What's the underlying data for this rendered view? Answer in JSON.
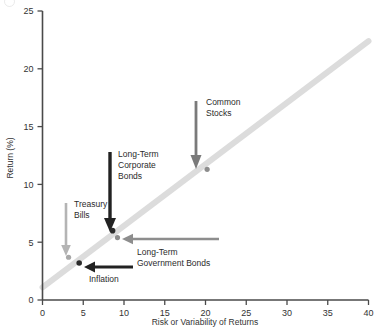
{
  "chart_data": {
    "type": "scatter",
    "title": "",
    "xlabel": "Risk or Variability of Returns",
    "ylabel": "Return (%)",
    "xlim": [
      0,
      40
    ],
    "ylim": [
      0,
      25
    ],
    "xticks": [
      "0",
      "5",
      "10",
      "15",
      "20",
      "25",
      "30",
      "35",
      "40"
    ],
    "yticks": [
      "0",
      "5",
      "10",
      "15",
      "20",
      "25"
    ],
    "grid": false,
    "legend": "none",
    "points": [
      {
        "name": "Treasury Bills",
        "x": 3.2,
        "y": 3.7,
        "color": "#a8a8a8",
        "radius": 2.6
      },
      {
        "name": "Inflation",
        "x": 4.5,
        "y": 3.2,
        "color": "#2b2b2b",
        "radius": 2.8
      },
      {
        "name": "Long-Term Government Bonds",
        "x": 9.2,
        "y": 5.4,
        "color": "#8d8d8d",
        "radius": 2.6
      },
      {
        "name": "Long-Term Corporate Bonds",
        "x": 8.6,
        "y": 6.0,
        "color": "#2b2b2b",
        "radius": 2.8
      },
      {
        "name": "Common Stocks",
        "x": 20.2,
        "y": 11.3,
        "color": "#8d8d8d",
        "radius": 2.6
      }
    ],
    "trendline": {
      "x0": 0,
      "y0": 1.1,
      "x1": 40,
      "y1": 22.4,
      "color": "#dcdcdc",
      "width": 6
    },
    "annotations": [
      {
        "id": "treasury-bills",
        "label": [
          "Treasury",
          "Bills"
        ],
        "arrow": "down",
        "color": "#b4b4b4"
      },
      {
        "id": "corporate-bonds",
        "label": [
          "Long-Term",
          "Corporate",
          "Bonds"
        ],
        "arrow": "down",
        "color": "#222222"
      },
      {
        "id": "common-stocks",
        "label": [
          "Common",
          "Stocks"
        ],
        "arrow": "down",
        "color": "#7a7a7a"
      },
      {
        "id": "government-bonds",
        "label": [
          "Long-Term",
          "Government Bonds"
        ],
        "arrow": "left",
        "color": "#8d8d8d"
      },
      {
        "id": "inflation",
        "label": [
          "Inflation"
        ],
        "arrow": "left",
        "color": "#222222"
      }
    ],
    "axis_color": "#4a4a4a"
  },
  "colors": {
    "axis": "#4a4a4a",
    "trendline": "#dcdcdc",
    "dark": "#222222",
    "mid_gray": "#8d8d8d",
    "light_gray": "#b4b4b4",
    "background": "#ffffff"
  }
}
